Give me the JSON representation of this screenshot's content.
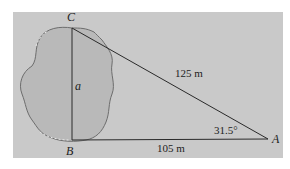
{
  "figure": {
    "vertices": {
      "A": {
        "label": "A"
      },
      "B": {
        "label": "B"
      },
      "C": {
        "label": "C"
      }
    },
    "sides": {
      "CA": {
        "label": "125 m"
      },
      "BA": {
        "label": "105 m"
      },
      "CB": {
        "label": "a"
      }
    },
    "angle_A": {
      "label": "31.5°"
    },
    "colors": {
      "background": "#c9c9c9",
      "pond_fill": "#b9b9b9",
      "pond_edge": "#6d6d6d",
      "lines": "#2a2a2a"
    }
  }
}
